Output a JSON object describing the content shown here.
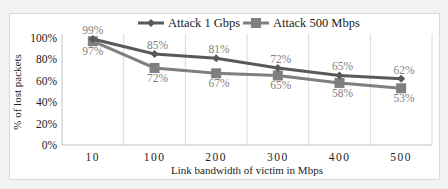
{
  "chart_data": {
    "type": "line",
    "title": "",
    "xlabel": "Link bandwidth of victim in Mbps",
    "ylabel": "% of lost packets",
    "categories": [
      "10",
      "100",
      "200",
      "300",
      "400",
      "500"
    ],
    "series": [
      {
        "name": "Attack 1 Gbps",
        "marker": "diamond",
        "color": "#595959",
        "values": [
          99,
          85,
          81,
          72,
          65,
          62
        ],
        "labels": [
          "99%",
          "85%",
          "81%",
          "72%",
          "65%",
          "62%"
        ]
      },
      {
        "name": "Attack 500 Mbps",
        "marker": "square",
        "color": "#7f7f7f",
        "values": [
          97,
          72,
          67,
          65,
          58,
          53
        ],
        "labels": [
          "97%",
          "72%",
          "67%",
          "65%",
          "58%",
          "53%"
        ]
      }
    ],
    "yticks": [
      "0%",
      "20%",
      "40%",
      "60%",
      "80%",
      "100%"
    ],
    "ylim": [
      0,
      100
    ],
    "grid": {
      "vertical": true,
      "horizontal": false
    },
    "legend_position": "top"
  }
}
